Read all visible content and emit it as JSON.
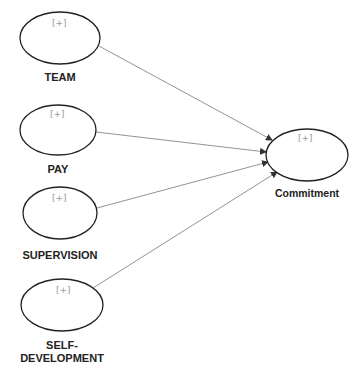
{
  "diagram": {
    "type": "path-model",
    "nodes": [
      {
        "id": "team",
        "label": "TEAM",
        "marker": "[+]",
        "cx": 60,
        "cy": 38,
        "rx": 40,
        "ry": 26
      },
      {
        "id": "pay",
        "label": "PAY",
        "marker": "[+]",
        "cx": 58,
        "cy": 130,
        "rx": 38,
        "ry": 25
      },
      {
        "id": "supervision",
        "label": "SUPERVISION",
        "marker": "[+]",
        "cx": 60,
        "cy": 213,
        "rx": 37,
        "ry": 26
      },
      {
        "id": "self_development",
        "label": "SELF-\nDEVELOPMENT",
        "label_lines": [
          "SELF-",
          "DEVELOPMENT"
        ],
        "marker": "[+]",
        "cx": 62,
        "cy": 305,
        "rx": 41,
        "ry": 26
      },
      {
        "id": "commitment",
        "label": "Commitment",
        "marker": "[+]",
        "cx": 307,
        "cy": 155,
        "rx": 41,
        "ry": 26
      }
    ],
    "edges": [
      {
        "from": "team",
        "to": "commitment"
      },
      {
        "from": "pay",
        "to": "commitment"
      },
      {
        "from": "supervision",
        "to": "commitment"
      },
      {
        "from": "self_development",
        "to": "commitment"
      }
    ]
  },
  "labels": {
    "team": "TEAM",
    "pay": "PAY",
    "supervision": "SUPERVISION",
    "self_dev_1": "SELF-",
    "self_dev_2": "DEVELOPMENT",
    "commitment": "Commitment",
    "marker": "[+]"
  }
}
